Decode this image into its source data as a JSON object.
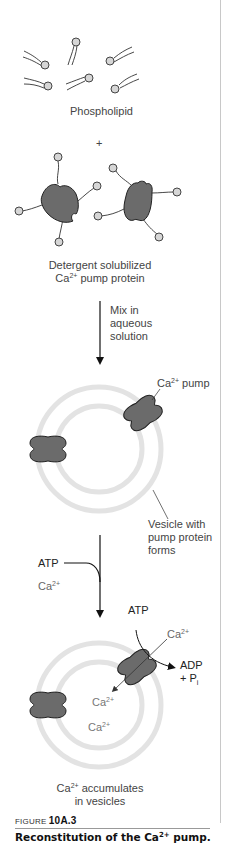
{
  "figure": {
    "labels": {
      "phospholipid": "Phospholipid",
      "plus": "+",
      "detergent_line1": "Detergent solubilized",
      "detergent_line2_pre": "Ca",
      "detergent_line2_sup": "2+",
      "detergent_line2_post": " pump protein",
      "mix_line1": "Mix in",
      "mix_line2": "aqueous",
      "mix_line3": "solution",
      "ca_pump_pre": "Ca",
      "ca_pump_sup": "2+",
      "ca_pump_post": " pump",
      "vesicle_line1": "Vesicle with",
      "vesicle_line2": "pump protein",
      "vesicle_line3": "forms",
      "atp_in": "ATP",
      "ca_in_pre": "Ca",
      "ca_in_sup": "2+",
      "atp_pump": "ATP",
      "ca_pump_in_pre": "Ca",
      "ca_pump_in_sup": "2+",
      "adp_line1": "ADP",
      "adp_line2_pre": "+ P",
      "adp_line2_sub": "i",
      "ca_inside1_pre": "Ca",
      "ca_inside1_sup": "2+",
      "ca_inside2_pre": "Ca",
      "ca_inside2_sup": "2+",
      "accum_line1_pre": "Ca",
      "accum_line1_sup": "2+",
      "accum_line1_post": " accumulates",
      "accum_line2": "in vesicles"
    },
    "colors": {
      "protein_fill": "#6b6b6b",
      "outline": "#2a2a2a",
      "membrane": "#e3e3e3",
      "lipid_head": "#d6d6d6"
    }
  },
  "caption": {
    "prefix": "FIGURE ",
    "number": "10A.3",
    "title_pre": "Reconstitution of the Ca",
    "title_sup": "2+",
    "title_post": " pump."
  }
}
